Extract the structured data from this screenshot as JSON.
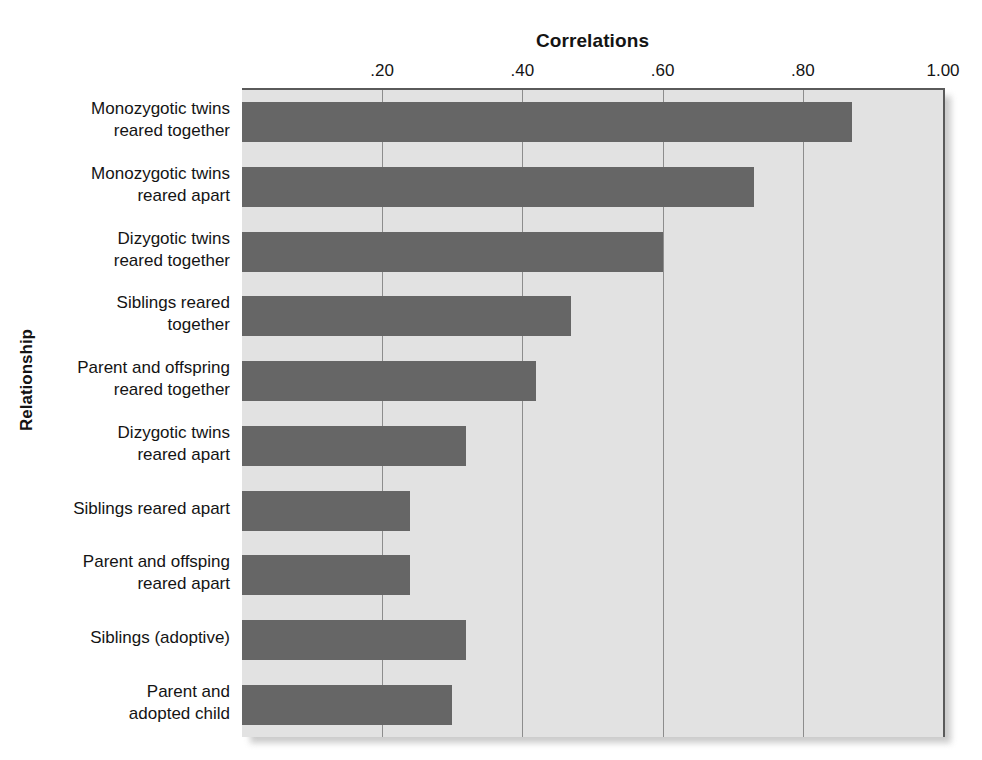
{
  "chart_data": {
    "type": "bar",
    "orientation": "horizontal",
    "title": "Correlations",
    "xlabel": "Correlations",
    "ylabel": "Relationship",
    "xlim": [
      0,
      1.0
    ],
    "grid": true,
    "legend": null,
    "xticks": [
      {
        "value": 0.2,
        "label": ".20"
      },
      {
        "value": 0.4,
        "label": ".40"
      },
      {
        "value": 0.6,
        "label": ".60"
      },
      {
        "value": 0.8,
        "label": ".80"
      },
      {
        "value": 1.0,
        "label": "1.00"
      }
    ],
    "bar_color": "#666666",
    "plot_background": "#e2e2e2",
    "categories": [
      "Monozygotic twins\nreared together",
      "Monozygotic twins\nreared apart",
      "Dizygotic twins\nreared together",
      "Siblings reared\ntogether",
      "Parent and offspring\nreared together",
      "Dizygotic twins\nreared apart",
      "Siblings reared apart",
      "Parent and offsping\nreared apart",
      "Siblings (adoptive)",
      "Parent and\nadopted child"
    ],
    "values": [
      0.87,
      0.73,
      0.6,
      0.47,
      0.42,
      0.32,
      0.24,
      0.24,
      0.32,
      0.3
    ]
  }
}
